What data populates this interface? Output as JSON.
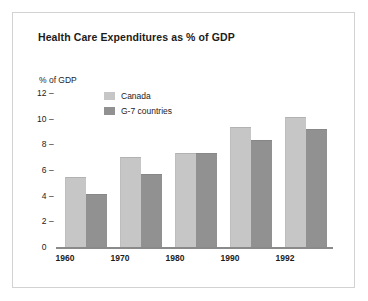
{
  "chart_data": {
    "type": "bar",
    "title": "Health Care Expenditures as % of GDP",
    "xlabel": "",
    "ylabel": "% of GDP",
    "categories": [
      "1960",
      "1970",
      "1980",
      "1990",
      "1992"
    ],
    "series": [
      {
        "name": "Canada",
        "color": "#c6c6c6",
        "values": [
          5.5,
          7.1,
          7.4,
          9.4,
          10.2
        ]
      },
      {
        "name": "G-7 countries",
        "color": "#919191",
        "values": [
          4.2,
          5.8,
          7.4,
          8.4,
          9.3
        ]
      }
    ],
    "ylim": [
      0,
      12
    ],
    "yticks": [
      "12",
      "10",
      "8",
      "6",
      "4",
      "2",
      "0"
    ],
    "ytick_values": [
      12,
      10,
      8,
      6,
      4,
      2,
      0
    ],
    "tick_mark": "–",
    "grid": false,
    "legend_position": "top-left-inside"
  },
  "frame": {
    "border_color": "#d2d2d2",
    "background": "#ffffff"
  },
  "axis": {
    "baseline_color": "#8a8a8a"
  }
}
